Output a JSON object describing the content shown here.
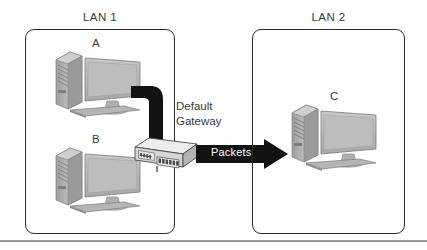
{
  "diagram": {
    "colors": {
      "box_border": "#2b2b2b",
      "label_text": "#3a3a3a",
      "cable": "#111111",
      "arrow": "#121212",
      "arrow_text": "#ffffff",
      "computer_body": "#b8b8b8",
      "computer_shade": "#8f8f8f",
      "switch_body": "#dcdcdc",
      "rule": "#9a9a9a"
    },
    "networks": [
      {
        "id": "lan1",
        "label": "LAN 1",
        "hosts": [
          {
            "id": "a",
            "label": "A",
            "icon": "desktop-computer-icon"
          },
          {
            "id": "b",
            "label": "B",
            "icon": "desktop-computer-icon"
          }
        ]
      },
      {
        "id": "lan2",
        "label": "LAN 2",
        "hosts": [
          {
            "id": "c",
            "label": "C",
            "icon": "desktop-computer-icon"
          }
        ]
      }
    ],
    "gateway": {
      "label_line1": "Default",
      "label_line2": "Gateway",
      "icon": "network-switch-icon"
    },
    "flow": {
      "label": "Packets",
      "icon": "right-arrow-icon",
      "direction": "left-to-right"
    }
  }
}
